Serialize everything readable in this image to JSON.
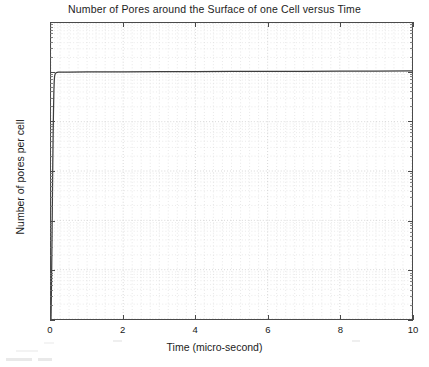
{
  "chart_data": {
    "type": "line",
    "title": "Number of Pores around the Surface of one Cell versus Time",
    "xlabel": "Time  (micro-second)",
    "ylabel": "Number of pores per cell",
    "xscale": "linear",
    "yscale": "log",
    "xlim": [
      0,
      10
    ],
    "ylim": [
      1,
      1000000
    ],
    "grid": true,
    "grid_style": "dotted",
    "legend": null,
    "xticks": [
      0,
      2,
      4,
      6,
      8,
      10
    ],
    "xtick_labels": [
      "0",
      "2",
      "4",
      "6",
      "8",
      "10"
    ],
    "yticks": [
      1,
      10,
      100,
      1000,
      10000,
      100000,
      1000000
    ],
    "ytick_labels": [
      "10^0",
      "10^1",
      "10^2",
      "10^3",
      "10^4",
      "10^5",
      "10^6"
    ],
    "ytick_mantissa": [
      "10",
      "10",
      "10",
      "10",
      "10",
      "10",
      "10"
    ],
    "ytick_exponent": [
      "0",
      "1",
      "2",
      "3",
      "4",
      "5",
      "6"
    ],
    "series": [
      {
        "name": "pores per cell",
        "color": "#3d3d3d",
        "x": [
          0.0,
          0.01,
          0.02,
          0.03,
          0.04,
          0.05,
          0.06,
          0.07,
          0.08,
          0.09,
          0.1,
          0.12,
          0.15,
          0.2,
          0.3,
          0.5,
          1.0,
          2.0,
          3.0,
          4.0,
          5.0,
          6.0,
          7.0,
          8.0,
          9.0,
          10.0
        ],
        "y": [
          1,
          3,
          12,
          60,
          320,
          1500,
          6000,
          18000,
          42000,
          68000,
          84000,
          95000,
          99000,
          100500,
          101000,
          101500,
          102000,
          102500,
          103000,
          103500,
          104000,
          104500,
          105000,
          105500,
          106000,
          107000
        ]
      }
    ]
  },
  "figure": {
    "background": "#ffffff",
    "axis_color": "#4a4a4a",
    "grid_color": "#b4b4b4"
  }
}
